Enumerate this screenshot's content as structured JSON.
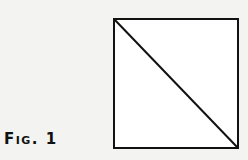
{
  "figure": {
    "label": "Fig. 1",
    "shape": "square-with-diagonal",
    "square": {
      "x": 114,
      "y": 19,
      "width": 124,
      "height": 129
    },
    "diagonal": {
      "from": "top-left",
      "to": "bottom-right"
    },
    "stroke_color": "#111111",
    "fill_color": "#ffffff"
  }
}
